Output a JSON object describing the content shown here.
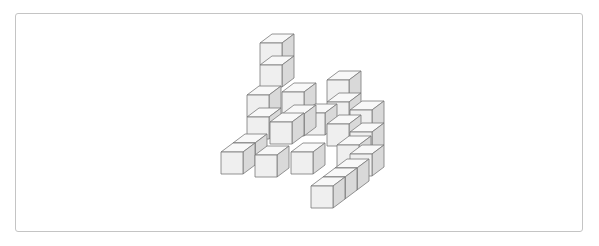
{
  "figure": {
    "cube_size": 22,
    "depth_dx": 12,
    "depth_dy": -9,
    "colors": {
      "front": "#efefef",
      "top": "#f8f8f8",
      "side": "#d9d9d9",
      "edge": "#7a7a7a",
      "border": "#c4c4c4"
    },
    "cubes": [
      {
        "x": 221,
        "y": 152
      },
      {
        "x": 233,
        "y": 143
      },
      {
        "x": 247,
        "y": 117
      },
      {
        "x": 247,
        "y": 95
      },
      {
        "x": 282,
        "y": 92
      },
      {
        "x": 282,
        "y": 114
      },
      {
        "x": 260,
        "y": 65
      },
      {
        "x": 260,
        "y": 43
      },
      {
        "x": 303,
        "y": 113
      },
      {
        "x": 270,
        "y": 122
      },
      {
        "x": 255,
        "y": 155
      },
      {
        "x": 291,
        "y": 152
      },
      {
        "x": 327,
        "y": 124
      },
      {
        "x": 327,
        "y": 102
      },
      {
        "x": 327,
        "y": 80
      },
      {
        "x": 350,
        "y": 132
      },
      {
        "x": 350,
        "y": 110
      },
      {
        "x": 350,
        "y": 154
      },
      {
        "x": 337,
        "y": 145
      },
      {
        "x": 335,
        "y": 168
      },
      {
        "x": 323,
        "y": 177
      },
      {
        "x": 311,
        "y": 186
      }
    ]
  }
}
